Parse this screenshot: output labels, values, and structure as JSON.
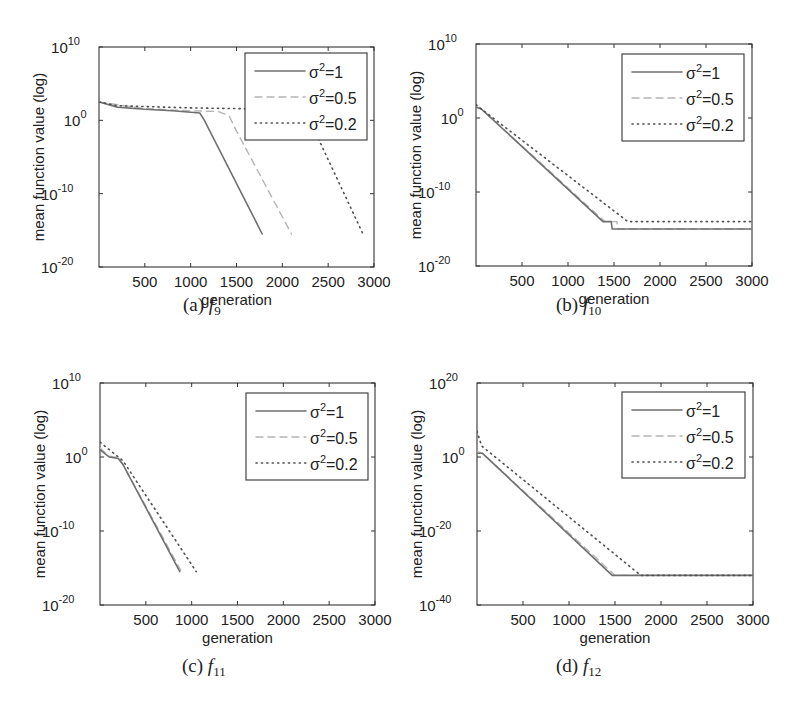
{
  "figure": {
    "panels": [
      {
        "id": "a",
        "caption_label": "(a)",
        "caption_func": "f",
        "caption_sub": "9"
      },
      {
        "id": "b",
        "caption_label": "(b)",
        "caption_func": "f",
        "caption_sub": "10"
      },
      {
        "id": "c",
        "caption_label": "(c)",
        "caption_func": "f",
        "caption_sub": "11"
      },
      {
        "id": "d",
        "caption_label": "(d)",
        "caption_func": "f",
        "caption_sub": "12"
      }
    ]
  },
  "chart_data": [
    {
      "type": "line",
      "title": "(a) f9",
      "xlabel": "generation",
      "ylabel": "mean function value (log)",
      "yscale": "log",
      "xlim": [
        0,
        3000
      ],
      "ylim_log10": [
        -20,
        10
      ],
      "xticks": [
        500,
        1000,
        1500,
        2000,
        2500,
        3000
      ],
      "yticks_log10": [
        10,
        0,
        -10,
        -20
      ],
      "ytick_labels": [
        "10^10",
        "10^0",
        "10^-10",
        "10^-20"
      ],
      "grid": false,
      "legend_position": "upper right",
      "series": [
        {
          "name": "σ²=1",
          "style": "solid",
          "x": [
            0,
            200,
            500,
            800,
            1100,
            1150,
            1780
          ],
          "log10_y": [
            2.5,
            1.8,
            1.5,
            1.3,
            1.0,
            0.0,
            -15.5
          ]
        },
        {
          "name": "σ²=0.5",
          "style": "dashed",
          "x": [
            0,
            500,
            1000,
            1300,
            1420,
            1480,
            2100
          ],
          "log10_y": [
            2.5,
            1.6,
            1.3,
            1.2,
            0.6,
            -1.0,
            -15.5
          ]
        },
        {
          "name": "σ²=0.2",
          "style": "dotted",
          "x": [
            0,
            200,
            1000,
            2000,
            2250,
            2880
          ],
          "log10_y": [
            2.5,
            2.0,
            1.7,
            1.5,
            1.3,
            -15.5
          ]
        }
      ]
    },
    {
      "type": "line",
      "title": "(b) f10",
      "xlabel": "generation",
      "ylabel": "mean function value (log)",
      "yscale": "log",
      "xlim": [
        0,
        3000
      ],
      "ylim_log10": [
        -20,
        10
      ],
      "xticks": [
        500,
        1000,
        1500,
        2000,
        2500,
        3000
      ],
      "yticks_log10": [
        10,
        0,
        -10,
        -20
      ],
      "ytick_labels": [
        "10^10",
        "10^0",
        "10^-10",
        "10^-20"
      ],
      "grid": false,
      "legend_position": "upper right",
      "series": [
        {
          "name": "σ²=1",
          "style": "solid",
          "x": [
            0,
            60,
            1380,
            1470,
            1480,
            3000
          ],
          "log10_y": [
            1.5,
            1.2,
            -14.0,
            -14.0,
            -15.0,
            -15.0
          ]
        },
        {
          "name": "σ²=0.5",
          "style": "dashed",
          "x": [
            0,
            60,
            1400,
            1530,
            1540,
            3000
          ],
          "log10_y": [
            1.5,
            1.2,
            -14.0,
            -14.0,
            -15.0,
            -15.0
          ]
        },
        {
          "name": "σ²=0.2",
          "style": "dotted",
          "x": [
            0,
            60,
            1650,
            3000
          ],
          "log10_y": [
            1.8,
            1.2,
            -14.0,
            -14.0
          ]
        }
      ]
    },
    {
      "type": "line",
      "title": "(c) f11",
      "xlabel": "generation",
      "ylabel": "mean function value (log)",
      "yscale": "log",
      "xlim": [
        0,
        3000
      ],
      "ylim_log10": [
        -20,
        10
      ],
      "xticks": [
        500,
        1000,
        1500,
        2000,
        2500,
        3000
      ],
      "yticks_log10": [
        10,
        0,
        -10,
        -20
      ],
      "ytick_labels": [
        "10^10",
        "10^0",
        "10^-10",
        "10^-20"
      ],
      "grid": false,
      "legend_position": "upper right",
      "series": [
        {
          "name": "σ²=1",
          "style": "solid",
          "x": [
            0,
            100,
            200,
            250,
            870
          ],
          "log10_y": [
            1.0,
            0.0,
            -0.2,
            -1.0,
            -15.5
          ]
        },
        {
          "name": "σ²=0.5",
          "style": "dashed",
          "x": [
            0,
            100,
            200,
            250,
            880
          ],
          "log10_y": [
            1.2,
            0.1,
            -0.1,
            -1.0,
            -15.3
          ]
        },
        {
          "name": "σ²=0.2",
          "style": "dotted",
          "x": [
            0,
            250,
            1050
          ],
          "log10_y": [
            2.0,
            -0.5,
            -15.5
          ]
        }
      ]
    },
    {
      "type": "line",
      "title": "(d) f12",
      "xlabel": "generation",
      "ylabel": "mean function value (log)",
      "yscale": "log",
      "xlim": [
        0,
        3000
      ],
      "ylim_log10": [
        -40,
        20
      ],
      "xticks": [
        500,
        1000,
        1500,
        2000,
        2500,
        3000
      ],
      "yticks_log10": [
        20,
        0,
        -20,
        -40
      ],
      "ytick_labels": [
        "10^20",
        "10^0",
        "10^-20",
        "10^-40"
      ],
      "grid": false,
      "legend_position": "upper right",
      "series": [
        {
          "name": "σ²=1",
          "style": "solid",
          "x": [
            0,
            60,
            1470,
            3000
          ],
          "log10_y": [
            1.0,
            1.0,
            -32.0,
            -32.0
          ]
        },
        {
          "name": "σ²=0.5",
          "style": "dashed",
          "x": [
            0,
            60,
            1500,
            3000
          ],
          "log10_y": [
            1.5,
            1.0,
            -32.0,
            -32.0
          ]
        },
        {
          "name": "σ²=0.2",
          "style": "dotted",
          "x": [
            0,
            50,
            1780,
            3000
          ],
          "log10_y": [
            7.0,
            3.0,
            -32.0,
            -32.0
          ]
        }
      ]
    }
  ]
}
